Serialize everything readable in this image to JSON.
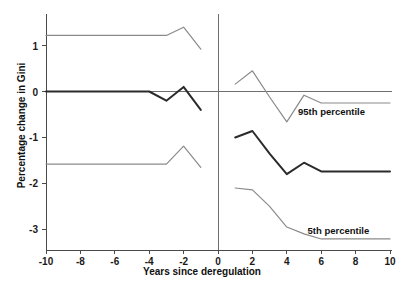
{
  "chart_data": {
    "type": "line",
    "title": "",
    "xlabel": "Years since deregulation",
    "ylabel": "Percentage change in Gini",
    "xlim": [
      -10,
      10
    ],
    "ylim": [
      -3.45,
      1.6
    ],
    "xticks": [
      -10,
      -8,
      -6,
      -4,
      -2,
      0,
      2,
      4,
      6,
      8,
      10
    ],
    "xtick_labels": [
      "-10",
      "-8",
      "-6",
      "-4",
      "-2",
      "0",
      "2",
      "4",
      "6",
      "8",
      "10"
    ],
    "yticks": [
      1,
      0,
      -1,
      -2,
      -3
    ],
    "ytick_labels": [
      "1",
      "0",
      "-1",
      "-2",
      "-3"
    ],
    "grid": false,
    "legend_position": "inline-annotation",
    "zero_line_y": 0,
    "event_line_x": 0,
    "annotations": [
      {
        "text": "95th percentile",
        "x": 6.6,
        "y": -0.42
      },
      {
        "text": "5th percentile",
        "x": 7.0,
        "y": -3.02
      }
    ],
    "series": [
      {
        "name": "95th percentile",
        "role": "upper-confidence-band",
        "color": "#8a8a8a",
        "width": 1.2,
        "segments": [
          {
            "name": "pre-deregulation",
            "x": [
              -10,
              -9,
              -8,
              -7,
              -6,
              -5,
              -4,
              -3,
              -2,
              -1
            ],
            "values": [
              1.22,
              1.22,
              1.22,
              1.22,
              1.22,
              1.22,
              1.22,
              1.22,
              1.4,
              0.92
            ]
          },
          {
            "name": "post-deregulation",
            "x": [
              1,
              2,
              3,
              4,
              5,
              6,
              7,
              8,
              9,
              10
            ],
            "values": [
              0.16,
              0.45,
              -0.12,
              -0.66,
              -0.08,
              -0.25,
              -0.25,
              -0.25,
              -0.25,
              -0.25
            ]
          }
        ]
      },
      {
        "name": "Point estimate",
        "role": "central-estimate",
        "color": "#2b2b2b",
        "width": 2.0,
        "segments": [
          {
            "name": "pre-deregulation",
            "x": [
              -10,
              -9,
              -8,
              -7,
              -6,
              -5,
              -4,
              -3,
              -2,
              -1
            ],
            "values": [
              0.0,
              0.0,
              0.0,
              0.0,
              0.0,
              0.0,
              0.0,
              -0.2,
              0.1,
              -0.4
            ]
          },
          {
            "name": "post-deregulation",
            "x": [
              1,
              2,
              3,
              4,
              5,
              6,
              7,
              8,
              9,
              10
            ],
            "values": [
              -1.0,
              -0.86,
              -1.35,
              -1.8,
              -1.55,
              -1.74,
              -1.74,
              -1.74,
              -1.74,
              -1.74
            ]
          }
        ]
      },
      {
        "name": "5th percentile",
        "role": "lower-confidence-band",
        "color": "#8a8a8a",
        "width": 1.2,
        "segments": [
          {
            "name": "pre-deregulation",
            "x": [
              -10,
              -9,
              -8,
              -7,
              -6,
              -5,
              -4,
              -3,
              -2,
              -1
            ],
            "values": [
              -1.58,
              -1.58,
              -1.58,
              -1.58,
              -1.58,
              -1.58,
              -1.58,
              -1.58,
              -1.19,
              -1.65
            ]
          },
          {
            "name": "post-deregulation",
            "x": [
              1,
              2,
              3,
              4,
              5,
              6,
              7,
              8,
              9,
              10
            ],
            "values": [
              -2.1,
              -2.14,
              -2.5,
              -2.95,
              -3.1,
              -3.21,
              -3.21,
              -3.21,
              -3.21,
              -3.21
            ]
          }
        ]
      }
    ]
  },
  "axes": {
    "zero_line_color": "#6e6e6e",
    "axis_color": "#4a4a4a"
  }
}
